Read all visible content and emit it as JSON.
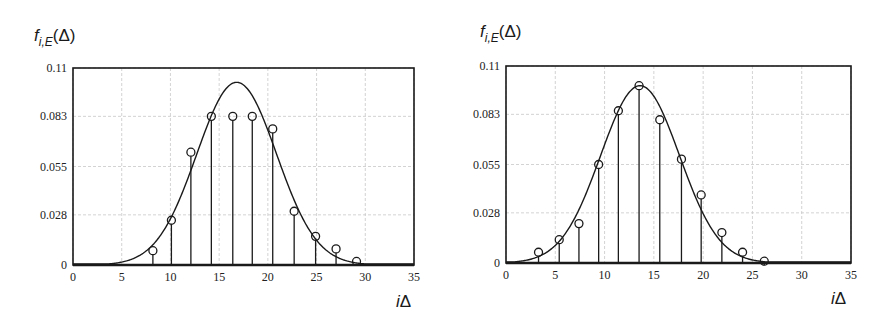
{
  "chart_data": [
    {
      "type": "scatter",
      "subtype": "stem plot with fitted curve",
      "title": "",
      "ylabel": {
        "f": "f",
        "sub": "i,E",
        "arg": "(Δ)"
      },
      "xlabel": {
        "i": "i",
        "rest": "Δ"
      },
      "xlim": [
        0,
        35
      ],
      "ylim": [
        0,
        0.11
      ],
      "x_ticks": [
        "0",
        "5",
        "10",
        "15",
        "20",
        "25",
        "30",
        "35"
      ],
      "y_ticks": [
        "0",
        "0.028",
        "0.055",
        "0.083",
        "0.11"
      ],
      "grid": true,
      "series": [
        {
          "name": "empirical frequencies (stems with circles)",
          "x": [
            8.2,
            10.1,
            12.1,
            14.2,
            16.4,
            18.4,
            20.5,
            22.7,
            24.9,
            27.0,
            29.1
          ],
          "y": [
            0.008,
            0.025,
            0.063,
            0.083,
            0.083,
            0.083,
            0.076,
            0.03,
            0.016,
            0.009,
            0.002
          ]
        },
        {
          "name": "fitted density curve",
          "peak_x": 16.8,
          "peak_y": 0.102,
          "sigma": 4.1
        }
      ]
    },
    {
      "type": "scatter",
      "subtype": "stem plot with fitted curve",
      "title": "",
      "ylabel": {
        "f": "f",
        "sub": "i,E",
        "arg": "(Δ)"
      },
      "xlabel": {
        "i": "i",
        "rest": "Δ"
      },
      "xlim": [
        0,
        35
      ],
      "ylim": [
        0,
        0.11
      ],
      "x_ticks": [
        "0",
        "5",
        "10",
        "15",
        "20",
        "25",
        "30",
        "35"
      ],
      "y_ticks": [
        "0",
        "0.028",
        "0.055",
        "0.083",
        "0.11"
      ],
      "grid": true,
      "series": [
        {
          "name": "empirical frequencies (stems with circles)",
          "x": [
            3.3,
            5.4,
            7.4,
            9.4,
            11.4,
            13.5,
            15.6,
            17.8,
            19.8,
            21.9,
            24.0,
            26.2
          ],
          "y": [
            0.006,
            0.013,
            0.022,
            0.055,
            0.085,
            0.099,
            0.08,
            0.058,
            0.038,
            0.017,
            0.006,
            0.001
          ]
        },
        {
          "name": "fitted density curve",
          "peak_x": 13.6,
          "peak_y": 0.099,
          "sigma": 4.0
        }
      ]
    }
  ],
  "panels": [
    {
      "frame": {
        "left": 73,
        "top": 68,
        "right": 414,
        "bottom": 265
      },
      "title_pos": {
        "x": 34,
        "y": 26
      },
      "xlabel_pos": {
        "x": 400,
        "y": 292
      }
    },
    {
      "frame": {
        "left": 506,
        "top": 66,
        "right": 851,
        "bottom": 263
      },
      "title_pos": {
        "x": 480,
        "y": 22
      },
      "xlabel_pos": {
        "x": 836,
        "y": 290
      }
    }
  ]
}
